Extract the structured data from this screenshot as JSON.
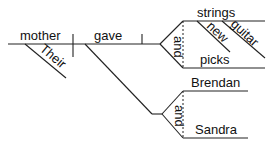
{
  "diagram": {
    "type": "sentence-diagram",
    "subject": "mother",
    "subject_modifier": "Their",
    "verb": "gave",
    "direct_objects": {
      "conjunction": "and",
      "items": [
        {
          "word": "strings",
          "modifiers": [
            "new",
            "guitar"
          ]
        },
        {
          "word": "picks",
          "modifiers": []
        }
      ]
    },
    "indirect_objects": {
      "conjunction": "and",
      "items": [
        {
          "word": "Brendan"
        },
        {
          "word": "Sandra"
        }
      ]
    }
  }
}
